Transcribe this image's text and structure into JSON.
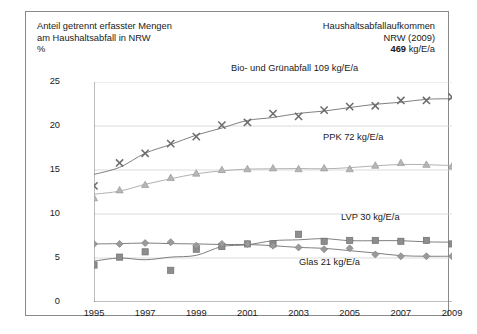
{
  "header": {
    "left_line1": "Anteil getrennt erfasster Mengen",
    "left_line2": "am Haushaltsabfall in NRW",
    "left_line3": "%",
    "right_line1": "Haushaltsabfallaufkommen",
    "right_line2": "NRW (2009)",
    "right_value": "469",
    "right_unit": "kg/E/a"
  },
  "chart_data": {
    "type": "line",
    "title": "Anteil getrennt erfasster Mengen am Haushaltsabfall in NRW",
    "xlabel": "",
    "ylabel": "%",
    "ylim": [
      0,
      25
    ],
    "xlim": [
      1995,
      2009
    ],
    "grid": true,
    "legend_position": "inline-labels",
    "yticks": [
      "0",
      "5",
      "10",
      "15",
      "20",
      "25"
    ],
    "ytick_values": [
      0,
      5,
      10,
      15,
      20,
      25
    ],
    "xticks": [
      "1995",
      "1997",
      "1999",
      "2001",
      "2003",
      "2005",
      "2007",
      "2009"
    ],
    "x": [
      1995,
      1996,
      1997,
      1998,
      1999,
      2000,
      2001,
      2002,
      2003,
      2004,
      2005,
      2006,
      2007,
      2008,
      2009
    ],
    "series": [
      {
        "name": "Bio- und Grünabfall",
        "label": "Bio- und Grünabfall 109 kg/E/a",
        "amount": "109 kg/E/a",
        "marker": "x",
        "color": "#6b6b6b",
        "values": [
          13.2,
          15.8,
          16.9,
          18.0,
          18.8,
          20.1,
          20.4,
          21.4,
          21.1,
          21.8,
          22.2,
          22.3,
          22.9,
          22.9,
          23.3
        ]
      },
      {
        "name": "PPK",
        "label": "PPK 72 kg/E/a",
        "amount": "72 kg/E/a",
        "marker": "triangle",
        "color": "#b6b6b6",
        "values": [
          11.8,
          12.7,
          13.3,
          14.1,
          14.6,
          15.0,
          15.1,
          15.2,
          15.1,
          15.2,
          15.1,
          15.5,
          15.8,
          15.6,
          15.4
        ]
      },
      {
        "name": "LVP",
        "label": "LVP 30 kg/E/a",
        "amount": "30 kg/E/a",
        "marker": "square",
        "color": "#8d8d8d",
        "values": [
          4.2,
          5.1,
          5.7,
          3.6,
          6.0,
          6.3,
          6.6,
          6.6,
          7.7,
          6.9,
          7.0,
          7.0,
          6.9,
          7.0,
          6.6
        ]
      },
      {
        "name": "Glas",
        "label": "Glas 21 kg/E/a",
        "amount": "21 kg/E/a",
        "marker": "diamond",
        "color": "#9a9a9a",
        "values": [
          6.6,
          6.6,
          6.7,
          6.8,
          6.4,
          6.6,
          6.6,
          6.4,
          6.2,
          6.0,
          6.1,
          5.4,
          5.2,
          5.2,
          5.2
        ]
      }
    ]
  }
}
